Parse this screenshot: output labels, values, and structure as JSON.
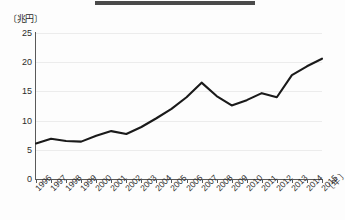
{
  "figure": {
    "title_bar_color": "#4a4a4a",
    "line_color": "#1a1a1a",
    "grid_color": "#ececec",
    "axis_color": "#595959"
  },
  "axis_unit_y": "〔兆円〕",
  "axis_unit_x": "〔年〕",
  "chart_data": {
    "type": "line",
    "title": "",
    "xlabel": "〔年〕",
    "ylabel": "〔兆円〕",
    "ylim": [
      0,
      25
    ],
    "yticks": [
      0,
      5,
      10,
      15,
      20,
      25
    ],
    "grid": true,
    "legend": "none",
    "categories": [
      "1996",
      "1997",
      "1998",
      "1999",
      "2000",
      "2001",
      "2002",
      "2003",
      "2004",
      "2005",
      "2006",
      "2007",
      "2008",
      "2009",
      "2010",
      "2011",
      "2012",
      "2013",
      "2014",
      "2015"
    ],
    "values": [
      6.1,
      6.9,
      6.5,
      6.4,
      7.4,
      8.2,
      7.7,
      8.9,
      10.4,
      12.0,
      14.0,
      16.5,
      14.2,
      12.6,
      13.5,
      14.7,
      14.0,
      17.8,
      19.3,
      20.6
    ]
  }
}
